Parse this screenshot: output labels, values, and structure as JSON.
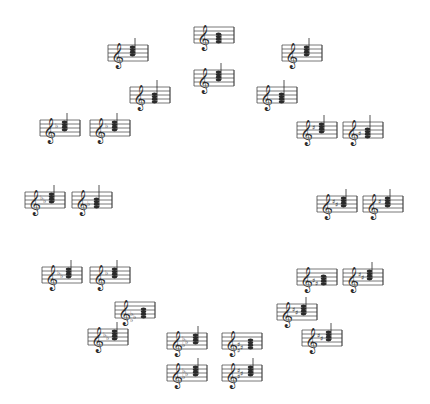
{
  "diagram": {
    "type": "chord-circle",
    "background": "#ffffff",
    "ink": "#2a2a2a",
    "staves": [
      {
        "id": "top-1",
        "x": 194,
        "y": 25,
        "acc": "",
        "accCount": 0,
        "stem": "down",
        "chordLow": true
      },
      {
        "id": "top-2",
        "x": 194,
        "y": 68,
        "acc": "",
        "accCount": 0,
        "stem": "up",
        "chordLow": false
      },
      {
        "id": "ul-1",
        "x": 108,
        "y": 43,
        "acc": "",
        "accCount": 0,
        "stem": "up",
        "chordLow": false
      },
      {
        "id": "ul-2",
        "x": 130,
        "y": 85,
        "acc": "",
        "accCount": 0,
        "stem": "up",
        "chordLow": true
      },
      {
        "id": "ur-1",
        "x": 282,
        "y": 43,
        "acc": "",
        "accCount": 0,
        "stem": "up",
        "chordLow": false
      },
      {
        "id": "ur-2",
        "x": 257,
        "y": 85,
        "acc": "",
        "accCount": 0,
        "stem": "up",
        "chordLow": true
      },
      {
        "id": "l1-1",
        "x": 40,
        "y": 118,
        "acc": "flat",
        "accCount": 1,
        "stem": "up",
        "chordLow": false
      },
      {
        "id": "l1-2",
        "x": 90,
        "y": 118,
        "acc": "flat",
        "accCount": 1,
        "stem": "up",
        "chordLow": false
      },
      {
        "id": "r1-1",
        "x": 297,
        "y": 120,
        "acc": "sharp",
        "accCount": 1,
        "stem": "up",
        "chordLow": false
      },
      {
        "id": "r1-2",
        "x": 343,
        "y": 120,
        "acc": "sharp",
        "accCount": 1,
        "stem": "up",
        "chordLow": true
      },
      {
        "id": "l2-1",
        "x": 25,
        "y": 190,
        "acc": "flat",
        "accCount": 2,
        "stem": "up",
        "chordLow": false
      },
      {
        "id": "l2-2",
        "x": 72,
        "y": 190,
        "acc": "flat",
        "accCount": 1,
        "stem": "up",
        "chordLow": true
      },
      {
        "id": "r2-1",
        "x": 317,
        "y": 194,
        "acc": "sharp",
        "accCount": 2,
        "stem": "up",
        "chordLow": false
      },
      {
        "id": "r2-2",
        "x": 363,
        "y": 194,
        "acc": "sharp",
        "accCount": 1,
        "stem": "up",
        "chordLow": false
      },
      {
        "id": "l3-1",
        "x": 42,
        "y": 265,
        "acc": "flat",
        "accCount": 2,
        "stem": "up",
        "chordLow": false
      },
      {
        "id": "l3-2",
        "x": 90,
        "y": 265,
        "acc": "flat",
        "accCount": 1,
        "stem": "up",
        "chordLow": false
      },
      {
        "id": "r3-1",
        "x": 297,
        "y": 267,
        "acc": "sharp",
        "accCount": 2,
        "stem": "down",
        "chordLow": true
      },
      {
        "id": "r3-2",
        "x": 343,
        "y": 267,
        "acc": "sharp",
        "accCount": 2,
        "stem": "up",
        "chordLow": false
      },
      {
        "id": "ll-1",
        "x": 115,
        "y": 300,
        "acc": "flat",
        "accCount": 3,
        "stem": "none",
        "chordLow": true
      },
      {
        "id": "ll-2",
        "x": 88,
        "y": 327,
        "acc": "flat",
        "accCount": 2,
        "stem": "up",
        "chordLow": false
      },
      {
        "id": "lr-1",
        "x": 277,
        "y": 302,
        "acc": "sharp",
        "accCount": 2,
        "stem": "up",
        "chordLow": false
      },
      {
        "id": "lr-2",
        "x": 302,
        "y": 328,
        "acc": "sharp",
        "accCount": 2,
        "stem": "up",
        "chordLow": false
      },
      {
        "id": "b-1",
        "x": 167,
        "y": 331,
        "acc": "flat",
        "accCount": 3,
        "stem": "up",
        "chordLow": false
      },
      {
        "id": "b-2",
        "x": 222,
        "y": 331,
        "acc": "sharp",
        "accCount": 3,
        "stem": "none",
        "chordLow": true
      },
      {
        "id": "b-3",
        "x": 167,
        "y": 363,
        "acc": "flat",
        "accCount": 3,
        "stem": "up",
        "chordLow": false
      },
      {
        "id": "b-4",
        "x": 222,
        "y": 363,
        "acc": "sharp",
        "accCount": 3,
        "stem": "up",
        "chordLow": false
      }
    ]
  },
  "symbols": {
    "clef": "𝄞",
    "flat": "♭",
    "sharp": "♯"
  }
}
